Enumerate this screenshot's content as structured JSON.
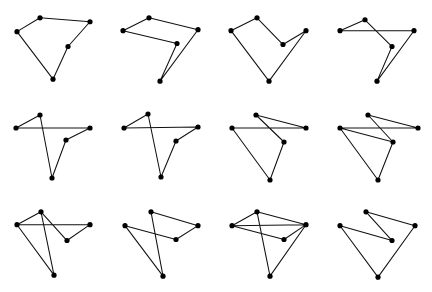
{
  "figure": {
    "title": "",
    "background_color": "#ffffff",
    "stroke_color": "#111111",
    "vertex_color": "#000000",
    "width": 432,
    "height": 292,
    "rows": 3,
    "columns": 4,
    "panel_count": 12
  },
  "chart_data": {
    "type": "scatter",
    "title": "",
    "xlabel": "",
    "ylabel": "",
    "xlim": [
      0,
      108
    ],
    "ylim": [
      0,
      98
    ],
    "grid": false,
    "legend": "none",
    "marker": "filled-circle",
    "marker_size": 2.6,
    "line_style": "solid",
    "panels": [
      {
        "index": 1,
        "label": "panel-1",
        "points": [
          {
            "name": "A",
            "x": 17,
            "y": 32
          },
          {
            "name": "B",
            "x": 40,
            "y": 18
          },
          {
            "name": "C",
            "x": 90,
            "y": 22
          },
          {
            "name": "D",
            "x": 68,
            "y": 47
          },
          {
            "name": "E",
            "x": 53,
            "y": 80
          }
        ],
        "order": [
          "A",
          "B",
          "C",
          "D",
          "E",
          "A"
        ],
        "closed": true
      },
      {
        "index": 2,
        "label": "panel-2",
        "points": [
          {
            "name": "A",
            "x": 15,
            "y": 31
          },
          {
            "name": "B",
            "x": 41,
            "y": 18
          },
          {
            "name": "C",
            "x": 90,
            "y": 30
          },
          {
            "name": "D",
            "x": 69,
            "y": 44
          },
          {
            "name": "E",
            "x": 52,
            "y": 82
          }
        ],
        "order": [
          "A",
          "B",
          "C",
          "E",
          "D",
          "A"
        ],
        "closed": true
      },
      {
        "index": 3,
        "label": "panel-3",
        "points": [
          {
            "name": "A",
            "x": 15,
            "y": 31
          },
          {
            "name": "B",
            "x": 41,
            "y": 18
          },
          {
            "name": "C",
            "x": 90,
            "y": 31
          },
          {
            "name": "D",
            "x": 67,
            "y": 45
          },
          {
            "name": "E",
            "x": 53,
            "y": 82
          }
        ],
        "order": [
          "A",
          "B",
          "D",
          "C",
          "E",
          "A"
        ],
        "closed": true
      },
      {
        "index": 4,
        "label": "panel-4",
        "points": [
          {
            "name": "A",
            "x": 16,
            "y": 31
          },
          {
            "name": "B",
            "x": 41,
            "y": 20
          },
          {
            "name": "C",
            "x": 90,
            "y": 31
          },
          {
            "name": "D",
            "x": 68,
            "y": 47
          },
          {
            "name": "E",
            "x": 53,
            "y": 82
          }
        ],
        "order": [
          "A",
          "B",
          "D",
          "E",
          "C",
          "A"
        ],
        "closed": true
      },
      {
        "index": 5,
        "label": "panel-5",
        "points": [
          {
            "name": "A",
            "x": 16,
            "y": 31
          },
          {
            "name": "B",
            "x": 40,
            "y": 18
          },
          {
            "name": "C",
            "x": 90,
            "y": 31
          },
          {
            "name": "D",
            "x": 66,
            "y": 43
          },
          {
            "name": "E",
            "x": 52,
            "y": 81
          }
        ],
        "order": [
          "A",
          "B",
          "E",
          "D",
          "C",
          "A"
        ],
        "closed": true
      },
      {
        "index": 6,
        "label": "panel-6",
        "points": [
          {
            "name": "A",
            "x": 16,
            "y": 31
          },
          {
            "name": "B",
            "x": 40,
            "y": 17
          },
          {
            "name": "C",
            "x": 90,
            "y": 30
          },
          {
            "name": "D",
            "x": 68,
            "y": 44
          },
          {
            "name": "E",
            "x": 53,
            "y": 80
          }
        ],
        "order": [
          "A",
          "B",
          "E",
          "D",
          "C",
          "A"
        ],
        "closed": true
      },
      {
        "index": 7,
        "label": "panel-7",
        "points": [
          {
            "name": "A",
            "x": 16,
            "y": 31
          },
          {
            "name": "B",
            "x": 40,
            "y": 18
          },
          {
            "name": "C",
            "x": 90,
            "y": 31
          },
          {
            "name": "D",
            "x": 68,
            "y": 45
          },
          {
            "name": "E",
            "x": 54,
            "y": 83
          }
        ],
        "order": [
          "A",
          "C",
          "B",
          "D",
          "E",
          "A"
        ],
        "closed": true
      },
      {
        "index": 8,
        "label": "panel-8",
        "points": [
          {
            "name": "A",
            "x": 16,
            "y": 31
          },
          {
            "name": "B",
            "x": 44,
            "y": 18
          },
          {
            "name": "C",
            "x": 94,
            "y": 31
          },
          {
            "name": "D",
            "x": 69,
            "y": 45
          },
          {
            "name": "E",
            "x": 54,
            "y": 83
          }
        ],
        "order": [
          "A",
          "D",
          "B",
          "C",
          "A",
          "E",
          "D"
        ],
        "closed": false
      },
      {
        "index": 9,
        "label": "panel-9",
        "points": [
          {
            "name": "A",
            "x": 17,
            "y": 30
          },
          {
            "name": "B",
            "x": 41,
            "y": 17
          },
          {
            "name": "C",
            "x": 90,
            "y": 30
          },
          {
            "name": "D",
            "x": 67,
            "y": 46
          },
          {
            "name": "E",
            "x": 54,
            "y": 81
          }
        ],
        "order": [
          "A",
          "C",
          "D",
          "B",
          "E",
          "B",
          "A",
          "E"
        ],
        "closed": false
      },
      {
        "index": 10,
        "label": "panel-10",
        "points": [
          {
            "name": "A",
            "x": 17,
            "y": 31
          },
          {
            "name": "B",
            "x": 43,
            "y": 17
          },
          {
            "name": "C",
            "x": 90,
            "y": 31
          },
          {
            "name": "D",
            "x": 68,
            "y": 45
          },
          {
            "name": "E",
            "x": 55,
            "y": 82
          }
        ],
        "order": [
          "A",
          "D",
          "C",
          "B",
          "E",
          "A"
        ],
        "closed": false
      },
      {
        "index": 11,
        "label": "panel-11",
        "points": [
          {
            "name": "A",
            "x": 16,
            "y": 31
          },
          {
            "name": "B",
            "x": 41,
            "y": 17
          },
          {
            "name": "C",
            "x": 90,
            "y": 30
          },
          {
            "name": "D",
            "x": 68,
            "y": 45
          },
          {
            "name": "E",
            "x": 54,
            "y": 82
          }
        ],
        "order": [
          "A",
          "C",
          "B",
          "E",
          "C",
          "D",
          "A",
          "B"
        ],
        "closed": false
      },
      {
        "index": 12,
        "label": "panel-12",
        "points": [
          {
            "name": "A",
            "x": 16,
            "y": 31
          },
          {
            "name": "B",
            "x": 42,
            "y": 17
          },
          {
            "name": "C",
            "x": 91,
            "y": 31
          },
          {
            "name": "D",
            "x": 68,
            "y": 46
          },
          {
            "name": "E",
            "x": 54,
            "y": 83
          }
        ],
        "order": [
          "A",
          "D",
          "B",
          "C",
          "E",
          "A"
        ],
        "closed": false
      }
    ]
  }
}
